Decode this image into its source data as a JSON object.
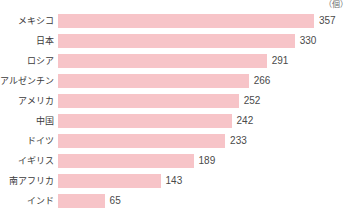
{
  "unit": "（個）",
  "chart_data": {
    "type": "bar",
    "orientation": "horizontal",
    "title": "",
    "subtitle": "",
    "xlabel": "",
    "ylabel": "",
    "unit_label": "（個）",
    "grid": false,
    "legend": null,
    "xlim": [
      0,
      357
    ],
    "bar_color": "#f7c4c8",
    "label_color": "#3b3b3b",
    "value_color": "#4a4a4a",
    "categories": [
      "メキシコ",
      "日本",
      "ロシア",
      "アルゼンチン",
      "アメリカ",
      "中国",
      "ドイツ",
      "イギリス",
      "南アフリカ",
      "インド"
    ],
    "values": [
      357,
      330,
      291,
      266,
      252,
      242,
      233,
      189,
      143,
      65
    ],
    "rows": [
      {
        "label": "メキシコ",
        "value": 357,
        "value_text": "357"
      },
      {
        "label": "日本",
        "value": 330,
        "value_text": "330"
      },
      {
        "label": "ロシア",
        "value": 291,
        "value_text": "291"
      },
      {
        "label": "アルゼンチン",
        "value": 266,
        "value_text": "266"
      },
      {
        "label": "アメリカ",
        "value": 252,
        "value_text": "252"
      },
      {
        "label": "中国",
        "value": 242,
        "value_text": "242"
      },
      {
        "label": "ドイツ",
        "value": 233,
        "value_text": "233"
      },
      {
        "label": "イギリス",
        "value": 189,
        "value_text": "189"
      },
      {
        "label": "南アフリカ",
        "value": 143,
        "value_text": "143"
      },
      {
        "label": "インド",
        "value": 65,
        "value_text": "65"
      }
    ]
  }
}
